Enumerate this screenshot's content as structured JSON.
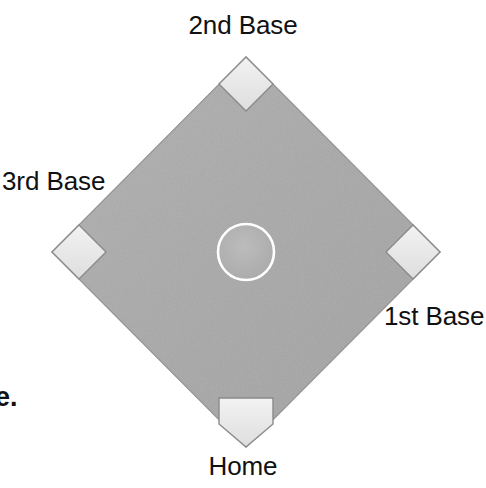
{
  "figure": {
    "kind": "baseball-diamond-diagram",
    "background_color": "#ffffff",
    "width": 486,
    "height": 488
  },
  "labels": {
    "second_base": "2nd Base",
    "third_base": "3rd Base",
    "first_base": "1st Base",
    "home_plate": "Home",
    "choice_marker": "e."
  },
  "colors": {
    "field_fill": "#a9a9a9",
    "field_fill_light": "#b2b2b2",
    "field_edge": "#8f8f8f",
    "base_fill": "#e6e6e6",
    "base_fill_light": "#f1f1f1",
    "base_outline": "#8a8a8a",
    "mound_outline": "#ffffff",
    "mound_fill": "#b3b3b3",
    "text_color": "#111111"
  },
  "geometry": {
    "diamond_center_x": 246,
    "diamond_center_y": 252,
    "diamond_half_diagonal_x": 194,
    "diamond_half_diagonal_y": 195,
    "base_half_size": 27,
    "mound_radius": 28
  },
  "elements": [
    {
      "name": "infield-diamond",
      "shape": "diamond",
      "label": ""
    },
    {
      "name": "second-base-bag",
      "shape": "square-rotated",
      "label": "2nd Base"
    },
    {
      "name": "third-base-bag",
      "shape": "square-rotated",
      "label": "3rd Base"
    },
    {
      "name": "first-base-bag",
      "shape": "square-rotated",
      "label": "1st Base"
    },
    {
      "name": "home-plate",
      "shape": "pentagon",
      "label": "Home"
    },
    {
      "name": "pitchers-mound",
      "shape": "circle",
      "label": ""
    }
  ]
}
